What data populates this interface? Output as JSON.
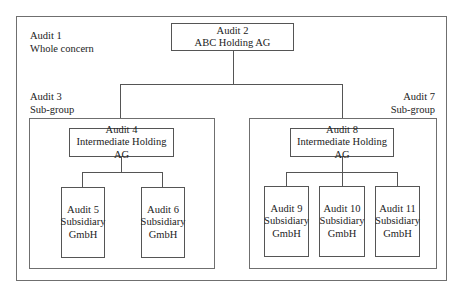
{
  "diagram": {
    "type": "org-chart",
    "colors": {
      "background": "#ffffff",
      "line": "#555555",
      "text": "#222222"
    },
    "whole_concern": {
      "label_line1": "Audit 1",
      "label_line2": "Whole concern"
    },
    "top_node": {
      "line1": "Audit 2",
      "line2": "ABC Holding AG"
    },
    "subgroups": [
      {
        "label_line1": "Audit 3",
        "label_line2": "Sub-group",
        "holding": {
          "line1": "Audit 4",
          "line2": "Intermediate Holding AG"
        },
        "subsidiaries": [
          {
            "line1": "Audit 5",
            "line2": "Subsidiary",
            "line3": "GmbH"
          },
          {
            "line1": "Audit 6",
            "line2": "Subsidiary",
            "line3": "GmbH"
          }
        ]
      },
      {
        "label_line1": "Audit 7",
        "label_line2": "Sub-group",
        "holding": {
          "line1": "Audit 8",
          "line2": "Intermediate Holding AG"
        },
        "subsidiaries": [
          {
            "line1": "Audit 9",
            "line2": "Subsidiary",
            "line3": "GmbH"
          },
          {
            "line1": "Audit 10",
            "line2": "Subsidiary",
            "line3": "GmbH"
          },
          {
            "line1": "Audit 11",
            "line2": "Subsidiary",
            "line3": "GmbH"
          }
        ]
      }
    ]
  }
}
